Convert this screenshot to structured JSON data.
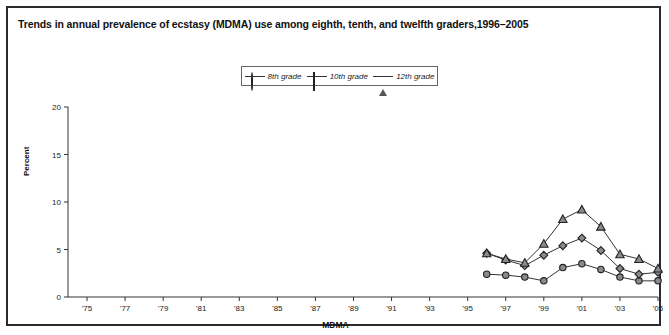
{
  "chart_data": {
    "type": "line",
    "title": "Trends in annual prevalence of ecstasy (MDMA) use among eighth, tenth, and twelfth graders,1996–2005",
    "xlabel": "MDMA",
    "ylabel": "Percent",
    "ylim": [
      0,
      20
    ],
    "yticks": [
      0,
      5,
      10,
      15,
      20
    ],
    "ytick_labels": [
      "0",
      "5",
      "10",
      "15",
      "20"
    ],
    "xlim": [
      1974,
      2005
    ],
    "xticks": [
      1975,
      1977,
      1979,
      1981,
      1983,
      1985,
      1987,
      1989,
      1991,
      1993,
      1995,
      1997,
      1999,
      2001,
      2003,
      2005
    ],
    "xtick_labels": [
      "'75",
      "'77",
      "'79",
      "'81",
      "'83",
      "'85",
      "'87",
      "'89",
      "'91",
      "'93",
      "'95",
      "'97",
      "'99",
      "'01",
      "'03",
      "'05"
    ],
    "grid": false,
    "legend_position": "top-center",
    "x": [
      1996,
      1997,
      1998,
      1999,
      2000,
      2001,
      2002,
      2003,
      2004,
      2005
    ],
    "series": [
      {
        "name": "8th grade",
        "marker": "circle",
        "values": [
          2.4,
          2.3,
          2.1,
          1.7,
          3.1,
          3.5,
          2.9,
          2.1,
          1.7,
          1.7
        ]
      },
      {
        "name": "10th grade",
        "marker": "diamond",
        "values": [
          4.6,
          3.9,
          3.3,
          4.4,
          5.4,
          6.2,
          4.9,
          3.0,
          2.4,
          2.6
        ]
      },
      {
        "name": "12th grade",
        "marker": "triangle",
        "values": [
          4.6,
          4.0,
          3.6,
          5.6,
          8.2,
          9.2,
          7.4,
          4.5,
          4.0,
          3.0
        ]
      }
    ]
  },
  "legend": {
    "items": [
      {
        "label": "8th grade",
        "icon": "circle-marker-icon"
      },
      {
        "label": "10th grade",
        "icon": "diamond-marker-icon"
      },
      {
        "label": "12th grade",
        "icon": "triangle-marker-icon"
      }
    ]
  },
  "colors": {
    "border": "#2b2b2b",
    "axis": "#333333",
    "marker_fill": "#8a8a8a",
    "marker_edge": "#222222",
    "line": "#333333",
    "text": "#111111",
    "background": "#ffffff"
  }
}
